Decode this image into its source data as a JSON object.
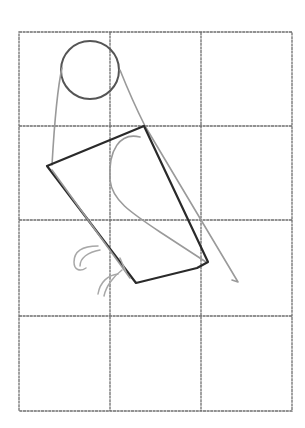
{
  "drawing": {
    "subject": "bird-sketch-step",
    "grid": {
      "left": 19,
      "top": 32,
      "right": 292,
      "bottom": 411,
      "columns": 3,
      "rows": 4,
      "color": "#6e6e6e"
    },
    "colors": {
      "background": "#ffffff",
      "ink": "#2a2a2a",
      "guide": "#9a9a9a",
      "head": "#555555"
    }
  }
}
